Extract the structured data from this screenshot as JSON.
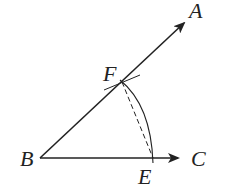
{
  "diagram": {
    "type": "angle-bisector-construction",
    "points": {
      "A": {
        "label": "A",
        "x": 185,
        "y": 22
      },
      "B": {
        "label": "B",
        "x": 40,
        "y": 158
      },
      "C": {
        "label": "C",
        "x": 178,
        "y": 158
      },
      "E": {
        "label": "E",
        "x": 153,
        "y": 158
      },
      "F": {
        "label": "F",
        "x": 122,
        "y": 81
      }
    },
    "rays": [
      {
        "from": "B",
        "to": "A",
        "arrow": true
      },
      {
        "from": "B",
        "to": "C",
        "arrow": true
      }
    ],
    "arcs": [
      {
        "center": "B",
        "from": "E",
        "to": "F",
        "style": "solid"
      }
    ],
    "segments": [
      {
        "from": "F",
        "to": "E",
        "style": "dashed"
      }
    ],
    "colors": {
      "stroke": "#222222",
      "background": "#ffffff"
    }
  }
}
